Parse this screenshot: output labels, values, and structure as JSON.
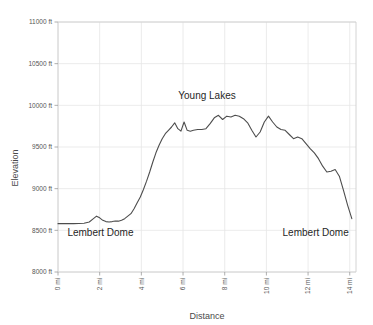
{
  "chart_data": {
    "type": "line",
    "title": "",
    "xlabel": "Distance",
    "ylabel": "Elevation",
    "xlim": [
      0,
      14.3
    ],
    "ylim": [
      8000,
      11000
    ],
    "grid": true,
    "legend": "none",
    "x_tick_labels": [
      "0 mi",
      "2 mi",
      "4 mi",
      "6 mi",
      "8 mi",
      "10 mi",
      "12 mi",
      "14 mi"
    ],
    "x_ticks": [
      0,
      2,
      4,
      6,
      8,
      10,
      12,
      14
    ],
    "y_tick_labels": [
      "8000 ft",
      "8500 ft",
      "9000 ft",
      "9500 ft",
      "10000 ft",
      "10500 ft",
      "11000 ft"
    ],
    "y_ticks": [
      8000,
      8500,
      9000,
      9500,
      10000,
      10500,
      11000
    ],
    "series": [
      {
        "name": "Elevation profile",
        "x": [
          0.0,
          0.25,
          0.5,
          0.75,
          1.0,
          1.25,
          1.5,
          1.7,
          1.85,
          2.0,
          2.15,
          2.3,
          2.45,
          2.6,
          2.75,
          2.9,
          3.05,
          3.2,
          3.35,
          3.5,
          3.65,
          3.8,
          3.95,
          4.1,
          4.25,
          4.4,
          4.55,
          4.7,
          4.85,
          5.0,
          5.15,
          5.3,
          5.45,
          5.6,
          5.75,
          5.9,
          6.05,
          6.2,
          6.35,
          6.5,
          6.7,
          6.9,
          7.1,
          7.3,
          7.5,
          7.7,
          7.9,
          8.1,
          8.3,
          8.5,
          8.7,
          8.9,
          9.1,
          9.3,
          9.5,
          9.7,
          9.9,
          10.1,
          10.3,
          10.5,
          10.7,
          10.9,
          11.1,
          11.3,
          11.5,
          11.7,
          11.9,
          12.1,
          12.3,
          12.5,
          12.7,
          12.9,
          13.1,
          13.3,
          13.5,
          13.7,
          13.9,
          14.1
        ],
        "y": [
          8580,
          8580,
          8580,
          8580,
          8582,
          8585,
          8600,
          8640,
          8670,
          8650,
          8620,
          8605,
          8600,
          8605,
          8612,
          8610,
          8620,
          8640,
          8670,
          8700,
          8760,
          8830,
          8900,
          8990,
          9090,
          9200,
          9320,
          9430,
          9520,
          9600,
          9660,
          9700,
          9740,
          9790,
          9720,
          9690,
          9800,
          9700,
          9690,
          9700,
          9710,
          9710,
          9720,
          9780,
          9850,
          9880,
          9830,
          9870,
          9860,
          9880,
          9870,
          9840,
          9790,
          9700,
          9620,
          9680,
          9800,
          9870,
          9800,
          9740,
          9710,
          9700,
          9650,
          9600,
          9620,
          9600,
          9540,
          9480,
          9430,
          9360,
          9270,
          9200,
          9210,
          9230,
          9150,
          8980,
          8800,
          8640
        ]
      }
    ],
    "annotations": [
      {
        "text": "Young Lakes",
        "x": 7.15,
        "y": 10080,
        "anchor": "middle"
      },
      {
        "text": "Lembert Dome",
        "x": 0.45,
        "y": 8430,
        "anchor": "start"
      },
      {
        "text": "Lembert Dome",
        "x": 13.95,
        "y": 8430,
        "anchor": "end"
      }
    ],
    "colors": {
      "line": "#4d4d4d",
      "grid": "#e6e6e6",
      "frame": "#cfcfcf",
      "text": "#3a3a3a",
      "background": "#ffffff"
    }
  },
  "figure": {
    "plot_left_px": 58,
    "plot_right_px": 356,
    "plot_top_px": 22,
    "plot_bottom_px": 272
  }
}
